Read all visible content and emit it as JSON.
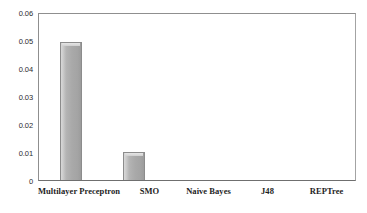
{
  "chart_data": {
    "type": "bar",
    "title": "",
    "subtitle": "",
    "xlabel": "",
    "ylabel": "",
    "categories": [
      "Multilayer Preceptron",
      "SMO",
      "Naive Bayes",
      "J48",
      "REPTree"
    ],
    "values": [
      0.05,
      0.01,
      0,
      0,
      0
    ],
    "ylim": [
      0,
      0.06
    ],
    "ytick_labels": [
      "0.06",
      "0.05",
      "0.04",
      "0.03",
      "0.02",
      "0.01",
      "0"
    ],
    "ytick_values": [
      0.06,
      0.05,
      0.04,
      0.03,
      0.02,
      0.01,
      0
    ],
    "grid": false,
    "legend": false,
    "legend_position": "none",
    "annotations": [],
    "colors": {
      "bar_fill": "#a9a9a9",
      "bar_highlight": "#d8d8d8",
      "bar_outline": "#8c8c8c",
      "axis_line": "#6f6f6f",
      "frame": "#9a9a9a",
      "background": "#ffffff",
      "tick_text": "#2b2b2b",
      "category_text": "#1e1e1e"
    }
  }
}
